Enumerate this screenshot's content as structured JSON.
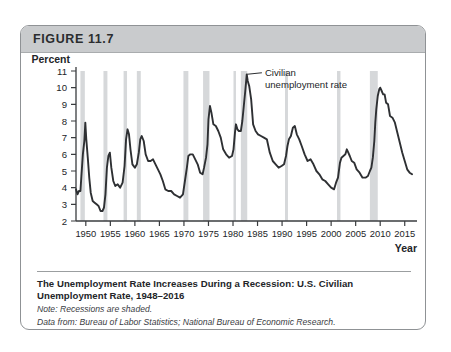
{
  "figure": {
    "header_label": "FIGURE 11.7",
    "caption_title": "The Unemployment Rate Increases During a Recession: U.S. Civilian Unemployment Rate, 1948–2016",
    "caption_note": "Note: Recessions are shaded.",
    "caption_source": "Data from: Bureau of Labor Statistics; National Bureau of Economic Research."
  },
  "colors": {
    "header_bg": "#c9cbcd",
    "frame_border": "#8f9295",
    "line": "#2e3033",
    "recession_band": "#d6d8da",
    "axis": "#3a3c3f",
    "text": "#232528"
  },
  "chart_data": {
    "type": "line",
    "title": "U.S. Civilian Unemployment Rate, 1948–2016",
    "xlabel": "Year",
    "ylabel": "Percent",
    "ylim": [
      2,
      11
    ],
    "xlim": [
      1948,
      2017.5
    ],
    "yticks": [
      2,
      3,
      4,
      5,
      6,
      7,
      8,
      9,
      10,
      11
    ],
    "xticks": [
      1950,
      1955,
      1960,
      1965,
      1970,
      1975,
      1980,
      1985,
      1990,
      1995,
      2000,
      2005,
      2010,
      2015
    ],
    "grid": false,
    "legend": "none",
    "annotations": [
      {
        "text": "Civilian unemployment rate",
        "target_x": 1982.9,
        "target_y": 10.8,
        "label_x": 1986.5,
        "label_y": 10.9
      }
    ],
    "shaded_regions_label": "Recessions are shaded",
    "shaded_regions": [
      {
        "start": 1948.9,
        "end": 1949.8
      },
      {
        "start": 1953.6,
        "end": 1954.4
      },
      {
        "start": 1957.7,
        "end": 1958.4
      },
      {
        "start": 1960.4,
        "end": 1961.2
      },
      {
        "start": 1969.9,
        "end": 1970.9
      },
      {
        "start": 1973.9,
        "end": 1975.2
      },
      {
        "start": 1980.1,
        "end": 1980.6
      },
      {
        "start": 1981.6,
        "end": 1982.9
      },
      {
        "start": 1990.6,
        "end": 1991.2
      },
      {
        "start": 2001.2,
        "end": 2001.9
      },
      {
        "start": 2007.9,
        "end": 2009.5
      }
    ],
    "series": [
      {
        "name": "Civilian unemployment rate",
        "x": [
          1948.0,
          1948.3,
          1948.6,
          1948.9,
          1949.1,
          1949.4,
          1949.7,
          1949.9,
          1950.1,
          1950.4,
          1950.7,
          1951.0,
          1951.4,
          1951.8,
          1952.2,
          1952.6,
          1953.0,
          1953.4,
          1953.7,
          1954.0,
          1954.3,
          1954.6,
          1954.9,
          1955.2,
          1955.6,
          1956.0,
          1956.5,
          1957.0,
          1957.5,
          1957.9,
          1958.2,
          1958.5,
          1958.8,
          1959.1,
          1959.5,
          1960.0,
          1960.4,
          1960.8,
          1961.1,
          1961.4,
          1961.8,
          1962.2,
          1962.7,
          1963.2,
          1963.7,
          1964.2,
          1964.7,
          1965.2,
          1965.7,
          1966.2,
          1966.8,
          1967.4,
          1968.0,
          1968.6,
          1969.2,
          1969.8,
          1970.2,
          1970.6,
          1970.9,
          1971.3,
          1971.8,
          1972.3,
          1972.8,
          1973.3,
          1973.8,
          1974.1,
          1974.5,
          1974.8,
          1975.0,
          1975.3,
          1975.6,
          1976.0,
          1976.5,
          1977.0,
          1977.5,
          1978.0,
          1978.6,
          1979.2,
          1979.8,
          1980.1,
          1980.4,
          1980.6,
          1980.9,
          1981.2,
          1981.6,
          1981.9,
          1982.2,
          1982.5,
          1982.8,
          1983.0,
          1983.3,
          1983.7,
          1984.1,
          1984.6,
          1985.1,
          1985.7,
          1986.3,
          1986.9,
          1987.5,
          1988.1,
          1988.7,
          1989.3,
          1989.9,
          1990.4,
          1990.8,
          1991.1,
          1991.4,
          1991.8,
          1992.2,
          1992.6,
          1993.0,
          1993.5,
          1994.0,
          1994.6,
          1995.2,
          1995.8,
          1996.4,
          1997.0,
          1997.6,
          1998.2,
          1998.8,
          1999.4,
          2000.0,
          2000.6,
          2001.0,
          2001.4,
          2001.8,
          2002.1,
          2002.5,
          2002.9,
          2003.2,
          2003.5,
          2003.8,
          2004.2,
          2004.7,
          2005.2,
          2005.8,
          2006.4,
          2007.0,
          2007.5,
          2007.9,
          2008.2,
          2008.5,
          2008.8,
          2009.0,
          2009.2,
          2009.5,
          2009.8,
          2010.0,
          2010.3,
          2010.6,
          2010.9,
          2011.2,
          2011.6,
          2012.0,
          2012.5,
          2013.0,
          2013.5,
          2014.0,
          2014.5,
          2015.0,
          2015.5,
          2016.0,
          2016.5
        ],
        "y": [
          3.9,
          3.6,
          3.8,
          3.8,
          4.7,
          6.0,
          6.8,
          7.9,
          6.9,
          5.8,
          4.6,
          3.7,
          3.2,
          3.1,
          3.0,
          2.9,
          2.6,
          2.6,
          2.8,
          3.6,
          5.2,
          5.9,
          6.1,
          5.2,
          4.4,
          4.1,
          4.2,
          4.0,
          4.3,
          5.3,
          6.9,
          7.5,
          7.2,
          6.3,
          5.4,
          5.2,
          5.4,
          6.1,
          6.9,
          7.1,
          6.8,
          6.0,
          5.6,
          5.6,
          5.7,
          5.4,
          5.1,
          4.8,
          4.4,
          3.9,
          3.8,
          3.8,
          3.6,
          3.5,
          3.4,
          3.6,
          4.4,
          5.2,
          5.9,
          6.0,
          6.0,
          5.7,
          5.4,
          4.9,
          4.8,
          5.2,
          5.8,
          6.6,
          8.1,
          8.9,
          8.5,
          7.8,
          7.7,
          7.4,
          7.0,
          6.3,
          6.0,
          5.8,
          5.9,
          6.3,
          7.3,
          7.8,
          7.5,
          7.4,
          7.4,
          8.0,
          8.9,
          9.8,
          10.8,
          10.4,
          10.1,
          9.3,
          7.8,
          7.4,
          7.2,
          7.1,
          7.0,
          6.9,
          6.1,
          5.6,
          5.4,
          5.2,
          5.3,
          5.4,
          5.9,
          6.5,
          6.9,
          7.1,
          7.6,
          7.7,
          7.2,
          6.9,
          6.5,
          6.0,
          5.6,
          5.7,
          5.4,
          5.0,
          4.8,
          4.5,
          4.4,
          4.2,
          4.0,
          3.9,
          4.3,
          4.6,
          5.5,
          5.8,
          5.9,
          6.0,
          6.3,
          6.1,
          5.9,
          5.6,
          5.5,
          5.1,
          4.9,
          4.6,
          4.6,
          4.7,
          5.0,
          5.2,
          5.8,
          6.8,
          7.9,
          8.7,
          9.5,
          9.9,
          10.0,
          9.8,
          9.6,
          9.6,
          9.1,
          9.0,
          8.3,
          8.2,
          7.9,
          7.3,
          6.7,
          6.1,
          5.6,
          5.1,
          4.9,
          4.8
        ]
      }
    ]
  }
}
